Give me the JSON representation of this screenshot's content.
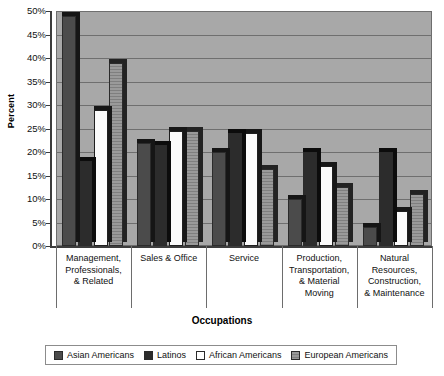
{
  "chart_data": {
    "type": "bar",
    "title": "",
    "xlabel": "Occupations",
    "ylabel": "Percent",
    "ylim": [
      0,
      50
    ],
    "ytick_step": 5,
    "ytick_labels": [
      "0%",
      "5%",
      "10%",
      "15%",
      "20%",
      "25%",
      "30%",
      "35%",
      "40%",
      "45%",
      "50%"
    ],
    "grid": true,
    "legend_position": "bottom",
    "categories": [
      "Management, Professionals, & Related",
      "Sales & Office",
      "Service",
      "Production, Transportation, & Material Moving",
      "Natural Resources, Construction, & Maintenance"
    ],
    "category_lines": [
      [
        "Management,",
        "Professionals,",
        "& Related"
      ],
      [
        "Sales & Office"
      ],
      [
        "Service"
      ],
      [
        "Production,",
        "Transportation,",
        "& Material",
        "Moving"
      ],
      [
        "Natural",
        "Resources,",
        "Construction,",
        "& Maintenance"
      ]
    ],
    "series": [
      {
        "name": "Asian Americans",
        "color": "#4b4b4b",
        "values": [
          49,
          22,
          20,
          10,
          4
        ]
      },
      {
        "name": "Latinos",
        "color": "#2c2c2c",
        "values": [
          18,
          21.5,
          24,
          20,
          20
        ]
      },
      {
        "name": "African Americans",
        "color": "#ffffff",
        "values": [
          29,
          24.5,
          24,
          17,
          7.5
        ]
      },
      {
        "name": "European Americans",
        "color": "#8e8e8e",
        "values": [
          39,
          24.5,
          16.5,
          12.5,
          11
        ]
      }
    ]
  },
  "colors": {
    "plot_background": "#a8a8a8",
    "gridline": "#6f6f6f",
    "axis": "#3c3c3c",
    "text": "#111111"
  }
}
